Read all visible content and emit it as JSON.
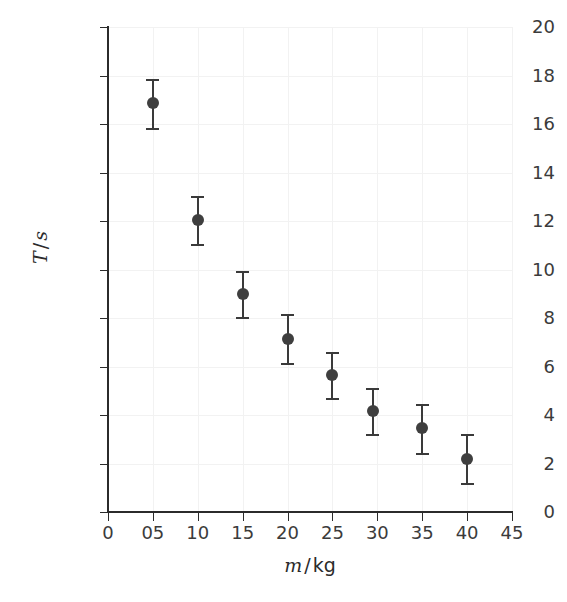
{
  "chart": {
    "type": "scatter",
    "title": "",
    "xlabel_var": "m",
    "xlabel_sep": "/",
    "xlabel_unit": "kg",
    "ylabel_var": "T",
    "ylabel_sep": "/",
    "ylabel_unit": "s",
    "marker_color": "#3f3f3f",
    "errorbar_color": "#3a3a3a",
    "grid_color": "#f2f2f2",
    "axis_color": "#2b2b2b",
    "background": "#ffffff"
  },
  "axes": {
    "x_ticklabels": [
      "0",
      "05",
      "10",
      "15",
      "20",
      "25",
      "30",
      "35",
      "40",
      "45"
    ],
    "x_tickvalues": [
      0,
      5,
      10,
      15,
      20,
      25,
      30,
      35,
      40,
      45
    ],
    "y_ticklabels": [
      "0",
      "2",
      "4",
      "6",
      "8",
      "10",
      "12",
      "14",
      "16",
      "18",
      "20"
    ],
    "y_tickvalues": [
      0,
      2,
      4,
      6,
      8,
      10,
      12,
      14,
      16,
      18,
      20
    ],
    "xlim": [
      0,
      45
    ],
    "ylim": [
      0,
      20
    ],
    "grid": true,
    "legend": "none"
  },
  "chart_data": {
    "type": "scatter",
    "title": "",
    "xlabel": "m / kg",
    "ylabel": "T / s",
    "xlim": [
      0,
      45
    ],
    "ylim": [
      0,
      20
    ],
    "grid": true,
    "legend_position": "none",
    "x": [
      5,
      10,
      15,
      20,
      25,
      29.5,
      35,
      40
    ],
    "y": [
      16.85,
      12.05,
      9.0,
      7.15,
      5.65,
      4.15,
      3.45,
      2.2
    ],
    "yerr": [
      1.0,
      1.0,
      0.95,
      1.0,
      0.95,
      0.95,
      1.0,
      1.0
    ],
    "x_ticklabels": [
      "0",
      "05",
      "10",
      "15",
      "20",
      "25",
      "30",
      "35",
      "40",
      "45"
    ],
    "y_ticklabels": [
      "0",
      "2",
      "4",
      "6",
      "8",
      "10",
      "12",
      "14",
      "16",
      "18",
      "20"
    ],
    "series": [
      {
        "name": "period vs mass",
        "points": [
          {
            "x": 5,
            "y": 16.85,
            "yerr": 1.0
          },
          {
            "x": 10,
            "y": 12.05,
            "yerr": 1.0
          },
          {
            "x": 15,
            "y": 9.0,
            "yerr": 0.95
          },
          {
            "x": 20,
            "y": 7.15,
            "yerr": 1.0
          },
          {
            "x": 25,
            "y": 5.65,
            "yerr": 0.95
          },
          {
            "x": 29.5,
            "y": 4.15,
            "yerr": 0.95
          },
          {
            "x": 35,
            "y": 3.45,
            "yerr": 1.0
          },
          {
            "x": 40,
            "y": 2.2,
            "yerr": 1.0
          }
        ]
      }
    ]
  }
}
